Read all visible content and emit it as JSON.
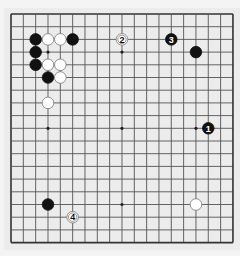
{
  "board": {
    "size": 19,
    "origin_x": 11,
    "origin_y": 14,
    "step_x": 12.33,
    "step_y": 12.7,
    "background": "#ececec",
    "line_color": "#555555",
    "border_color": "#333333",
    "black_color": "#111111",
    "white_color": "#ffffff",
    "star_points": [
      [
        3,
        3
      ],
      [
        9,
        3
      ],
      [
        15,
        3
      ],
      [
        3,
        9
      ],
      [
        9,
        9
      ],
      [
        15,
        9
      ],
      [
        3,
        15
      ],
      [
        9,
        15
      ],
      [
        15,
        15
      ]
    ]
  },
  "stones": [
    {
      "color": "black",
      "col": 2,
      "row": 2,
      "label": ""
    },
    {
      "color": "white",
      "col": 3,
      "row": 2,
      "label": ""
    },
    {
      "color": "white",
      "col": 4,
      "row": 2,
      "label": ""
    },
    {
      "color": "black",
      "col": 5,
      "row": 2,
      "label": ""
    },
    {
      "color": "black",
      "col": 2,
      "row": 3,
      "label": ""
    },
    {
      "color": "black",
      "col": 2,
      "row": 4,
      "label": ""
    },
    {
      "color": "white",
      "col": 3,
      "row": 4,
      "label": ""
    },
    {
      "color": "white",
      "col": 4,
      "row": 4,
      "label": ""
    },
    {
      "color": "black",
      "col": 3,
      "row": 5,
      "label": ""
    },
    {
      "color": "white",
      "col": 4,
      "row": 5,
      "label": ""
    },
    {
      "color": "white",
      "col": 3,
      "row": 7,
      "label": ""
    },
    {
      "color": "white",
      "col": 9,
      "row": 2,
      "label": "2"
    },
    {
      "color": "black",
      "col": 13,
      "row": 2,
      "label": "3"
    },
    {
      "color": "black",
      "col": 15,
      "row": 3,
      "label": ""
    },
    {
      "color": "black",
      "col": 16,
      "row": 9,
      "label": "1"
    },
    {
      "color": "black",
      "col": 3,
      "row": 15,
      "label": ""
    },
    {
      "color": "white",
      "col": 5,
      "row": 16,
      "label": "4"
    },
    {
      "color": "white",
      "col": 15,
      "row": 15,
      "label": ""
    }
  ]
}
